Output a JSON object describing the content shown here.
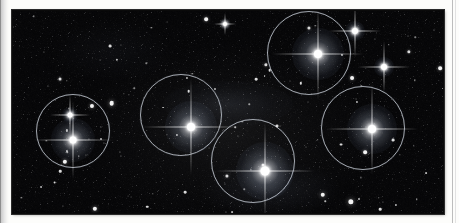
{
  "page": {
    "kind": "scanned-plate-figure",
    "background_color": "#fdfdfb",
    "gutter_shadow_color": "#b9b9b9",
    "right_rule_color": "#bdbdbd"
  },
  "plate": {
    "name": "star-field-photographic-plate",
    "left": 12,
    "top": 10,
    "width": 432,
    "height": 204,
    "sky_color": "#060606",
    "border_color": "#2a2a2a"
  },
  "marker_circles": {
    "stroke_color": "#cdd4dc",
    "stroke_width": 1,
    "count": 5,
    "items": [
      {
        "label": "marked-star-left",
        "cx": 60,
        "cy": 120,
        "r": 36
      },
      {
        "label": "marked-star-center-left",
        "cx": 168,
        "cy": 104,
        "r": 40
      },
      {
        "label": "marked-star-bottom-center",
        "cx": 240,
        "cy": 150,
        "r": 41
      },
      {
        "label": "marked-star-top-right",
        "cx": 296,
        "cy": 42,
        "r": 41
      },
      {
        "label": "marked-star-right",
        "cx": 350,
        "cy": 117,
        "r": 41
      }
    ]
  },
  "bright_stars": {
    "count": 9,
    "items": [
      {
        "label": "bright-star-left-primary",
        "cx": 60,
        "cy": 129,
        "core": 7,
        "halo": 44,
        "spike": 78
      },
      {
        "label": "bright-star-left-companion",
        "cx": 57,
        "cy": 104,
        "core": 5,
        "halo": 16,
        "spike": 40
      },
      {
        "label": "bright-star-center-left-primary",
        "cx": 178,
        "cy": 116,
        "core": 8,
        "halo": 52,
        "spike": 96
      },
      {
        "label": "bright-star-bottom-center",
        "cx": 252,
        "cy": 160,
        "core": 9,
        "halo": 58,
        "spike": 98
      },
      {
        "label": "bright-star-top-right",
        "cx": 305,
        "cy": 43,
        "core": 8,
        "halo": 52,
        "spike": 92
      },
      {
        "label": "bright-star-right",
        "cx": 359,
        "cy": 118,
        "core": 8,
        "halo": 50,
        "spike": 92
      },
      {
        "label": "bright-star-upper-right-corner",
        "cx": 342,
        "cy": 20,
        "core": 6,
        "halo": 20,
        "spike": 52
      },
      {
        "label": "bright-star-far-right-upper",
        "cx": 371,
        "cy": 56,
        "core": 6,
        "halo": 20,
        "spike": 52
      },
      {
        "label": "bright-star-top-edge-small",
        "cx": 212,
        "cy": 13,
        "core": 4,
        "halo": 11,
        "spike": 22
      }
    ]
  },
  "field_stars": {
    "count": 108,
    "color": "#ffffff",
    "note": "scattered faint background stars across the plate"
  }
}
